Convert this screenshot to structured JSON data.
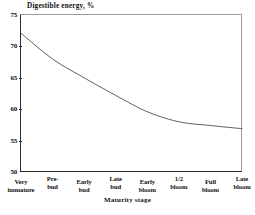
{
  "chart_data": {
    "type": "line",
    "title": "Digestible energy, %",
    "xlabel": "Maturity stage",
    "ylabel": "Digestible energy, %",
    "categories": [
      "Very immature",
      "Pre-bud",
      "Early bud",
      "Late bud",
      "Early bloom",
      "1/2 bloom",
      "Full bloom",
      "Late bloom"
    ],
    "category_lines": [
      [
        "Very",
        "immature"
      ],
      [
        "Pre-",
        "bud"
      ],
      [
        "Early",
        "bud"
      ],
      [
        "Late",
        "bud"
      ],
      [
        "Early",
        "bloom"
      ],
      [
        "1/2",
        "bloom"
      ],
      [
        "Full",
        "bloom"
      ],
      [
        "Late",
        "bloom"
      ]
    ],
    "values": [
      72.1,
      68.0,
      65.0,
      62.2,
      59.6,
      58.0,
      57.4,
      56.9
    ],
    "ylim": [
      50,
      75
    ],
    "yticks": [
      75,
      70,
      65,
      60,
      55,
      50
    ],
    "ytick_labels": [
      "75",
      "70",
      "65",
      "60",
      "55",
      "50"
    ],
    "grid": false,
    "legend": false,
    "line_color": "#4a4a4a",
    "axis_color": "#2a2a2a"
  },
  "axis": {
    "y_title": "Digestible energy, %",
    "x_title": "Maturity stage"
  }
}
